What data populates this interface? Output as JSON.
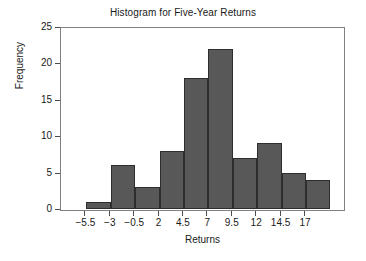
{
  "chart_data": {
    "type": "bar",
    "title": "Histogram for Five-Year Returns",
    "xlabel": "Returns",
    "ylabel": "Frequency",
    "categories": [
      "-5.5 to -3",
      "-3 to -0.5",
      "-0.5 to 2",
      "2 to 4.5",
      "4.5 to 7",
      "7 to 9.5",
      "9.5 to 12",
      "12 to 14.5",
      "14.5 to 17",
      "17 to 19.5"
    ],
    "values": [
      1,
      6,
      3,
      8,
      18,
      22,
      7,
      9,
      5,
      4
    ],
    "bin_edges": [
      -5.5,
      -3,
      -0.5,
      2,
      4.5,
      7,
      9.5,
      12,
      14.5,
      17,
      19.5
    ],
    "xticks": [
      "-5.5",
      "-3",
      "-0.5",
      "2",
      "4.5",
      "7",
      "9.5",
      "12",
      "14.5",
      "17"
    ],
    "xtick_values": [
      -5.5,
      -3,
      -0.5,
      2,
      4.5,
      7,
      9.5,
      12,
      14.5,
      17
    ],
    "yticks": [
      "0",
      "5",
      "10",
      "15",
      "20",
      "25"
    ],
    "ytick_values": [
      0,
      5,
      10,
      15,
      20,
      25
    ],
    "ylim": [
      0,
      25
    ],
    "xlim": [
      -8,
      21
    ],
    "grid": false,
    "legend": false,
    "bar_color": "#585858",
    "bar_edge_color": "#2e2e2e",
    "axis_color": "#808080",
    "text_color": "#1a1a1a",
    "background": "#ffffff"
  }
}
